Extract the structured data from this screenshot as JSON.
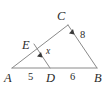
{
  "figure": {
    "type": "triangle-with-parallel-segment",
    "background_color": "#ffffff",
    "line_color": "#8a8a8a",
    "label_color": "#2b2b2b",
    "vertices": [
      {
        "name": "A",
        "label": "A",
        "x": 12,
        "y": 68,
        "label_x": 8,
        "label_y": 81
      },
      {
        "name": "B",
        "label": "B",
        "x": 97,
        "y": 68,
        "label_x": 98,
        "label_y": 81
      },
      {
        "name": "C",
        "label": "C",
        "x": 68,
        "y": 25,
        "label_x": 61,
        "label_y": 19
      },
      {
        "name": "D",
        "label": "D",
        "x": 50,
        "y": 68,
        "label_x": 51,
        "label_y": 81
      },
      {
        "name": "E",
        "label": "E",
        "x": 34,
        "y": 44,
        "label_x": 26,
        "label_y": 49
      }
    ],
    "segments": [
      {
        "name": "side-AB",
        "from": "A",
        "to": "B"
      },
      {
        "name": "side-AC",
        "from": "A",
        "to": "C"
      },
      {
        "name": "side-CB",
        "from": "C",
        "to": "B"
      },
      {
        "name": "segment-ED",
        "from": "E",
        "to": "D"
      }
    ],
    "measure_labels": [
      {
        "name": "length-AD",
        "text": "5",
        "x": 31,
        "y": 79,
        "on": "AD"
      },
      {
        "name": "length-DB",
        "text": "6",
        "x": 73,
        "y": 79,
        "on": "DB"
      },
      {
        "name": "length-CB",
        "text": "8",
        "x": 83,
        "y": 37,
        "on": "CB"
      },
      {
        "name": "length-ED",
        "text": "x",
        "x": 49,
        "y": 53,
        "on": "ED"
      }
    ],
    "parallel_marks": [
      {
        "name": "parallel-mark-ED",
        "x": 41,
        "y": 55,
        "angle": -124,
        "on": "ED"
      },
      {
        "name": "parallel-mark-CB",
        "x": 73,
        "y": 32,
        "angle": -124,
        "on": "CB"
      }
    ]
  }
}
